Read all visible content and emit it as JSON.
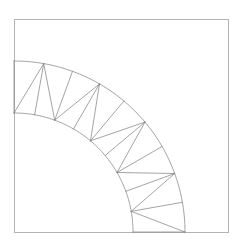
{
  "figure": {
    "background_color": "#ffffff",
    "width": 241,
    "height": 245
  },
  "frame": {
    "label": "bounding-box",
    "x": 14,
    "y": 19,
    "width": 214,
    "height": 213,
    "stroke_color": "#b4b4b4",
    "stroke_width": 1
  },
  "mesh": {
    "label": "quarter-annulus-triangulated",
    "stroke_color": "#7d7d7d",
    "stroke_width": 0.7,
    "center_x": 14,
    "center_y": 232,
    "inner_radius": 119,
    "outer_radius": 171,
    "start_angle_deg": 90,
    "end_angle_deg": 0,
    "segments": 9,
    "diagonal_pattern": "alternating",
    "arc_samples_per_segment": 12,
    "diagonals": [
      0,
      1,
      0,
      1,
      0,
      1,
      0,
      1,
      0
    ]
  },
  "chart_data": {
    "type": "line",
    "xlabel": "",
    "ylabel": "",
    "xlim": [
      14,
      228
    ],
    "ylim": [
      19,
      232
    ],
    "grid": false,
    "legend": "none",
    "annotations": [],
    "series": [
      {
        "name": "outer-arc",
        "kind": "arc",
        "center": [
          14,
          232
        ],
        "radius": 171,
        "angle_from_deg": 90,
        "angle_to_deg": 0
      },
      {
        "name": "inner-arc",
        "kind": "arc",
        "center": [
          14,
          232
        ],
        "radius": 119,
        "angle_from_deg": 90,
        "angle_to_deg": 0
      },
      {
        "name": "radial-spokes",
        "kind": "radial",
        "count": 10,
        "angles_deg": [
          90,
          80,
          70,
          60,
          50,
          40,
          30,
          20,
          10,
          0
        ]
      },
      {
        "name": "cell-diagonals",
        "kind": "diagonal",
        "count": 9
      }
    ]
  }
}
